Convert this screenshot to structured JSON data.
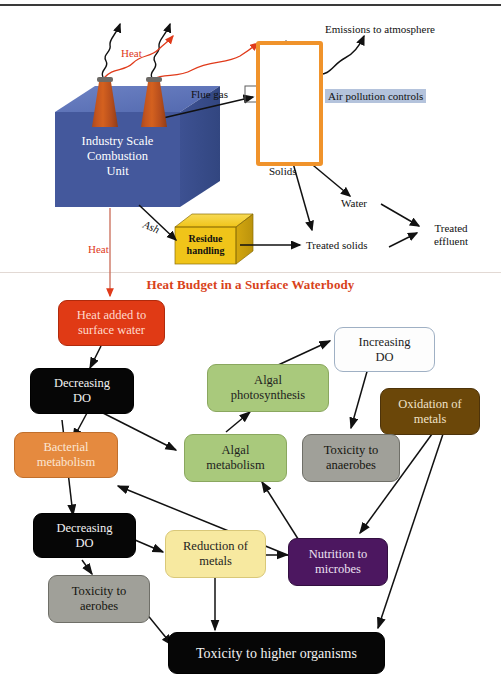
{
  "figure": {
    "top_section": {
      "combustion_unit_label": "Industry Scale\nCombustion\nUnit",
      "combustion_unit_lines": [
        "Industry Scale",
        "Combustion",
        "Unit"
      ],
      "combustion_unit_color": "#4a5ea3",
      "stack_color": "#c4551f",
      "heat_label": "Heat",
      "heat_color": "#e03a1a",
      "flue_gas_label": "Flue gas",
      "apc_label": "Air pollution controls",
      "apc_highlight_color": "#b4c3dc",
      "apc_frame_color": "#f0932b",
      "emissions_label": "Emissions to atmosphere",
      "solids_label": "Solids",
      "water_label": "Water",
      "treated_solids_label": "Treated solids",
      "treated_effluent_lines": [
        "Treated",
        "effluent"
      ],
      "ash_label": "Ash",
      "residue_lines": [
        "Residue",
        "handling"
      ],
      "residue_color": "#f0c419",
      "heat_down_label": "Heat"
    },
    "bottom_section": {
      "title": "Heat Budget in a Surface Waterbody",
      "title_color": "#d8421a",
      "nodes": [
        {
          "id": "heat-added",
          "lines": [
            "Heat added to",
            "surface water"
          ],
          "color": "#e03a15",
          "style": "n-red"
        },
        {
          "id": "decreasing-do-1",
          "lines": [
            "Decreasing",
            "DO"
          ],
          "color": "#060606",
          "style": "n-black"
        },
        {
          "id": "bacterial-metabolism",
          "lines": [
            "Bacterial",
            "metabolism"
          ],
          "color": "#e58a3f",
          "style": "n-orange"
        },
        {
          "id": "algal-photosynthesis",
          "lines": [
            "Algal",
            "photosynthesis"
          ],
          "color": "#a9c97c",
          "style": "n-green"
        },
        {
          "id": "increasing-do",
          "lines": [
            "Increasing",
            "DO"
          ],
          "color": "#fdfdfd",
          "style": "n-white"
        },
        {
          "id": "oxidation-of-metals",
          "lines": [
            "Oxidation of",
            "metals"
          ],
          "color": "#6b4709",
          "style": "n-brown"
        },
        {
          "id": "algal-metabolism",
          "lines": [
            "Algal",
            "metabolism"
          ],
          "color": "#a9c97c",
          "style": "n-green"
        },
        {
          "id": "toxicity-anaerobes",
          "lines": [
            "Toxicity to",
            "anaerobes"
          ],
          "color": "#a0a099",
          "style": "n-gray"
        },
        {
          "id": "decreasing-do-2",
          "lines": [
            "Decreasing",
            "DO"
          ],
          "color": "#060606",
          "style": "n-black"
        },
        {
          "id": "reduction-of-metals",
          "lines": [
            "Reduction of",
            "metals"
          ],
          "color": "#f7e9a0",
          "style": "n-yellow"
        },
        {
          "id": "nutrition-microbes",
          "lines": [
            "Nutrition to",
            "microbes"
          ],
          "color": "#4c1760",
          "style": "n-purple"
        },
        {
          "id": "toxicity-aerobes",
          "lines": [
            "Toxicity to",
            "aerobes"
          ],
          "color": "#a0a099",
          "style": "n-gray"
        },
        {
          "id": "toxicity-higher",
          "lines": [
            "Toxicity to higher organisms"
          ],
          "color": "#060606",
          "style": "n-black"
        }
      ],
      "edges": [
        "heat-added -> decreasing-do-1",
        "decreasing-do-1 -> bacterial-metabolism",
        "decreasing-do-1 -> algal-metabolism",
        "algal-metabolism -> algal-photosynthesis",
        "algal-photosynthesis -> increasing-do",
        "increasing-do -> toxicity-anaerobes",
        "decreasing-do-1 -> decreasing-do-2",
        "decreasing-do-2 -> reduction-of-metals",
        "decreasing-do-2 -> toxicity-aerobes",
        "reduction-of-metals -> nutrition-microbes",
        "reduction-of-metals -> toxicity-higher",
        "nutrition-microbes -> bacterial-metabolism",
        "nutrition-microbes -> algal-metabolism",
        "oxidation-of-metals -> nutrition-microbes",
        "oxidation-of-metals -> toxicity-higher",
        "toxicity-aerobes -> toxicity-higher"
      ]
    }
  },
  "t": {
    "industry_l1": "Industry Scale",
    "industry_l2": "Combustion",
    "industry_l3": "Unit",
    "heat_stack": "Heat",
    "flue_gas": "Flue gas",
    "apc": "Air pollution controls",
    "emissions": "Emissions to atmosphere",
    "solids": "Solids",
    "water": "Water",
    "treated_solids": "Treated solids",
    "treated_eff_1": "Treated",
    "treated_eff_2": "effluent",
    "ash": "Ash",
    "residue_1": "Residue",
    "residue_2": "handling",
    "heat_down": "Heat",
    "title": "Heat Budget in a Surface Waterbody",
    "heat_added_1": "Heat added to",
    "heat_added_2": "surface water",
    "dec_do_1a": "Decreasing",
    "dec_do_1b": "DO",
    "bact_1": "Bacterial",
    "bact_2": "metabolism",
    "algphoto_1": "Algal",
    "algphoto_2": "photosynthesis",
    "incdo_1": "Increasing",
    "incdo_2": "DO",
    "oxmet_1": "Oxidation of",
    "oxmet_2": "metals",
    "algmet_1": "Algal",
    "algmet_2": "metabolism",
    "toxana_1": "Toxicity to",
    "toxana_2": "anaerobes",
    "dec_do_2a": "Decreasing",
    "dec_do_2b": "DO",
    "redmet_1": "Reduction of",
    "redmet_2": "metals",
    "nutr_1": "Nutrition to",
    "nutr_2": "microbes",
    "toxaer_1": "Toxicity to",
    "toxaer_2": "aerobes",
    "toxhigh": "Toxicity to higher organisms"
  }
}
